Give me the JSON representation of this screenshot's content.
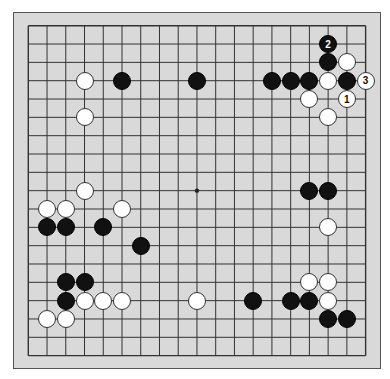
{
  "board": {
    "size": 19,
    "background": "#d9d9d9",
    "line_color": "#333333",
    "grid": {
      "x0": 28.3,
      "y0": 25.7,
      "dx": 18.74,
      "dy": 18.33
    },
    "star_points": [
      [
        9,
        9
      ]
    ]
  },
  "stones": [
    {
      "color": "white",
      "col": 3,
      "row": 3
    },
    {
      "color": "black",
      "col": 5,
      "row": 3
    },
    {
      "color": "black",
      "col": 9,
      "row": 3
    },
    {
      "color": "white",
      "col": 3,
      "row": 5
    },
    {
      "color": "black",
      "col": 16,
      "row": 1,
      "label": "2"
    },
    {
      "color": "black",
      "col": 16,
      "row": 2
    },
    {
      "color": "white",
      "col": 17,
      "row": 2
    },
    {
      "color": "black",
      "col": 13,
      "row": 3
    },
    {
      "color": "black",
      "col": 14,
      "row": 3
    },
    {
      "color": "black",
      "col": 15,
      "row": 3
    },
    {
      "color": "white",
      "col": 16,
      "row": 3
    },
    {
      "color": "black",
      "col": 17,
      "row": 3
    },
    {
      "color": "white",
      "col": 18,
      "row": 3,
      "label": "3"
    },
    {
      "color": "white",
      "col": 15,
      "row": 4
    },
    {
      "color": "white",
      "col": 17,
      "row": 4,
      "label": "1"
    },
    {
      "color": "white",
      "col": 16,
      "row": 5
    },
    {
      "color": "black",
      "col": 15,
      "row": 9
    },
    {
      "color": "black",
      "col": 16,
      "row": 9
    },
    {
      "color": "white",
      "col": 16,
      "row": 11
    },
    {
      "color": "white",
      "col": 3,
      "row": 9
    },
    {
      "color": "white",
      "col": 1,
      "row": 10
    },
    {
      "color": "white",
      "col": 2,
      "row": 10
    },
    {
      "color": "white",
      "col": 5,
      "row": 10
    },
    {
      "color": "black",
      "col": 1,
      "row": 11
    },
    {
      "color": "black",
      "col": 2,
      "row": 11
    },
    {
      "color": "black",
      "col": 4,
      "row": 11
    },
    {
      "color": "black",
      "col": 6,
      "row": 12
    },
    {
      "color": "black",
      "col": 2,
      "row": 14
    },
    {
      "color": "black",
      "col": 3,
      "row": 14
    },
    {
      "color": "black",
      "col": 2,
      "row": 15
    },
    {
      "color": "white",
      "col": 3,
      "row": 15
    },
    {
      "color": "white",
      "col": 4,
      "row": 15
    },
    {
      "color": "white",
      "col": 5,
      "row": 15
    },
    {
      "color": "white",
      "col": 9,
      "row": 15
    },
    {
      "color": "white",
      "col": 1,
      "row": 16
    },
    {
      "color": "white",
      "col": 2,
      "row": 16
    },
    {
      "color": "white",
      "col": 15,
      "row": 14
    },
    {
      "color": "white",
      "col": 16,
      "row": 14
    },
    {
      "color": "black",
      "col": 12,
      "row": 15
    },
    {
      "color": "black",
      "col": 14,
      "row": 15
    },
    {
      "color": "black",
      "col": 15,
      "row": 15
    },
    {
      "color": "white",
      "col": 16,
      "row": 15
    },
    {
      "color": "black",
      "col": 16,
      "row": 16
    },
    {
      "color": "black",
      "col": 17,
      "row": 16
    }
  ]
}
